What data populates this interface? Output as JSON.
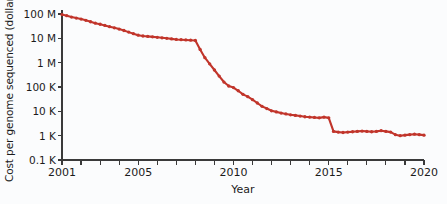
{
  "chart_data": {
    "type": "line",
    "title": "",
    "xlabel": "Year",
    "ylabel": "Cost per genome sequenced (dollars)",
    "yscale": "log",
    "ylim": [
      100,
      100000000
    ],
    "xlim": [
      2001,
      2020
    ],
    "grid": false,
    "legend": null,
    "line_color": "#c1352b",
    "marker_color": "#c1352b",
    "ytick_labels": [
      "100 M",
      "10 M",
      "1 M",
      "100 K",
      "10 K",
      "1 K",
      "0.1 K"
    ],
    "ytick_values": [
      100000000,
      10000000,
      1000000,
      100000,
      10000,
      1000,
      100
    ],
    "xtick_values": [
      2001,
      2002,
      2003,
      2004,
      2005,
      2006,
      2007,
      2008,
      2009,
      2010,
      2011,
      2012,
      2013,
      2014,
      2015,
      2016,
      2017,
      2018,
      2019,
      2020
    ],
    "xtick_labels_shown": [
      "2001",
      "2005",
      "2010",
      "2015",
      "2020"
    ],
    "series": [
      {
        "name": "Cost per genome",
        "x": [
          2001.0,
          2001.25,
          2001.5,
          2001.75,
          2002.0,
          2002.25,
          2002.5,
          2002.75,
          2003.0,
          2003.25,
          2003.5,
          2003.75,
          2004.0,
          2004.25,
          2004.5,
          2004.75,
          2005.0,
          2005.25,
          2005.5,
          2005.75,
          2006.0,
          2006.25,
          2006.5,
          2006.75,
          2007.0,
          2007.25,
          2007.5,
          2007.75,
          2008.0,
          2008.25,
          2008.5,
          2008.75,
          2009.0,
          2009.25,
          2009.5,
          2009.75,
          2010.0,
          2010.25,
          2010.5,
          2010.75,
          2011.0,
          2011.25,
          2011.5,
          2011.75,
          2012.0,
          2012.25,
          2012.5,
          2012.75,
          2013.0,
          2013.25,
          2013.5,
          2013.75,
          2014.0,
          2014.25,
          2014.5,
          2014.75,
          2015.0,
          2015.25,
          2015.5,
          2015.75,
          2016.0,
          2016.25,
          2016.5,
          2016.75,
          2017.0,
          2017.25,
          2017.5,
          2017.75,
          2018.0,
          2018.25,
          2018.5,
          2018.75,
          2019.0,
          2019.25,
          2019.5,
          2019.75,
          2020.0
        ],
        "y": [
          95000000,
          85000000,
          75000000,
          68000000,
          62000000,
          55000000,
          48000000,
          42000000,
          38000000,
          34000000,
          30000000,
          27000000,
          24000000,
          21000000,
          18000000,
          15500000,
          13500000,
          12500000,
          12000000,
          11500000,
          11000000,
          10500000,
          10000000,
          9500000,
          9000000,
          8800000,
          8600000,
          8400000,
          8200000,
          3500000,
          1600000,
          900000,
          500000,
          280000,
          160000,
          110000,
          95000,
          70000,
          50000,
          40000,
          30000,
          22000,
          16000,
          13000,
          10500,
          9500,
          8500,
          7800,
          7200,
          6800,
          6400,
          6000,
          5800,
          5600,
          5400,
          5800,
          5400,
          1500,
          1400,
          1350,
          1400,
          1450,
          1500,
          1550,
          1500,
          1450,
          1500,
          1600,
          1500,
          1400,
          1100,
          1000,
          1050,
          1100,
          1150,
          1100,
          1050
        ]
      }
    ]
  },
  "axis": {
    "x_title": "Year",
    "y_title": "Cost per genome sequenced (dollars)"
  }
}
